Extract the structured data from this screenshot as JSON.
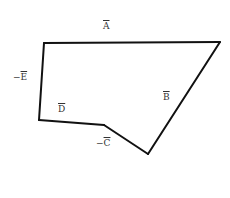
{
  "diagram": {
    "type": "vector-polygon",
    "stroke_color": "#111111",
    "background": "#ffffff",
    "vertices": [
      {
        "x": 44,
        "y": 43
      },
      {
        "x": 220,
        "y": 42
      },
      {
        "x": 148,
        "y": 154
      },
      {
        "x": 104,
        "y": 125
      },
      {
        "x": 39,
        "y": 120
      }
    ],
    "labels": [
      {
        "id": "A",
        "sign": "",
        "letter": "A",
        "x": 103,
        "y": 22
      },
      {
        "id": "B",
        "sign": "",
        "letter": "B",
        "x": 163,
        "y": 93
      },
      {
        "id": "C",
        "sign": "−",
        "letter": "C",
        "x": 96,
        "y": 139
      },
      {
        "id": "D",
        "sign": "",
        "letter": "D",
        "x": 58,
        "y": 105
      },
      {
        "id": "E",
        "sign": "−",
        "letter": "E",
        "x": 13,
        "y": 73
      }
    ]
  }
}
